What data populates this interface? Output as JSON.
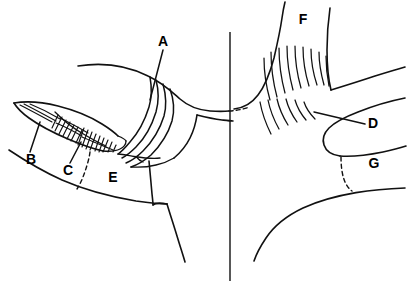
{
  "figure": {
    "background_color": "#ffffff",
    "line_color": "#111111",
    "label_color": "#000000",
    "width": 409,
    "height": 291
  },
  "labels": [
    {
      "id": "A",
      "text": "A",
      "x": 163,
      "y": 42,
      "has_leader": true
    },
    {
      "id": "B",
      "text": "B",
      "x": 31,
      "y": 160,
      "has_leader": true
    },
    {
      "id": "C",
      "text": "C",
      "x": 68,
      "y": 171,
      "has_leader": true
    },
    {
      "id": "D",
      "text": "D",
      "x": 373,
      "y": 124,
      "has_leader": true
    },
    {
      "id": "E",
      "text": "E",
      "x": 113,
      "y": 178,
      "has_leader": false
    },
    {
      "id": "F",
      "text": "F",
      "x": 303,
      "y": 20,
      "has_leader": false
    },
    {
      "id": "G",
      "text": "G",
      "x": 374,
      "y": 164,
      "has_leader": false
    }
  ],
  "regions": {
    "midline": {
      "name": "vertical-midline",
      "x": 230,
      "y_top": 32,
      "y_bottom": 281
    },
    "left_hatched_upper": {
      "name": "hatched-band-upper",
      "label_ref": "B"
    },
    "left_hatched_lower": {
      "name": "hatched-band-lower",
      "label_ref": "C"
    },
    "left_layered_bands": {
      "name": "layered-curved-bands",
      "label_ref": "A",
      "band_count": 4
    },
    "right_fiber_fan_upper": {
      "name": "radiating-fiber-fan-upper",
      "label_ref": "F",
      "fiber_count": 9
    },
    "right_fiber_fan_lower": {
      "name": "radiating-fiber-fan-lower",
      "label_ref": "D",
      "fiber_count": 6
    },
    "right_dashed_region": {
      "name": "dashed-boundary-region",
      "label_ref": "G"
    },
    "left_dashed_region": {
      "name": "dashed-boundary-left",
      "label_ref": "C"
    }
  }
}
